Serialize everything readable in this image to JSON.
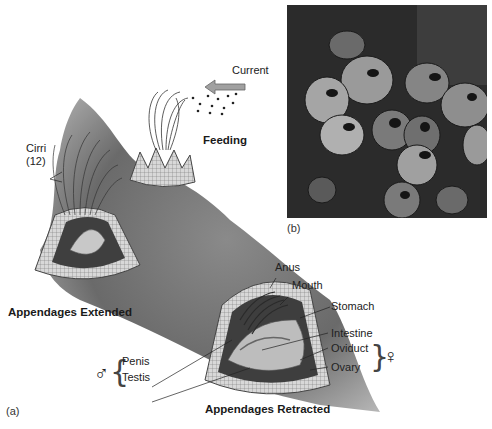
{
  "figure": {
    "panel_a": {
      "label": "(a)",
      "titles": {
        "feeding": "Feeding",
        "extended": "Appendages Extended",
        "retracted": "Appendages Retracted"
      },
      "current_label": "Current",
      "cirri_label_line1": "Cirri",
      "cirri_label_line2": "(12)",
      "anatomy_labels": {
        "anus": "Anus",
        "mouth": "Mouth",
        "stomach": "Stomach",
        "intestine": "Intestine",
        "oviduct": "Oviduct",
        "ovary": "Ovary",
        "penis": "Penis",
        "testis": "Testis"
      },
      "male_symbol": "♂",
      "female_symbol": "♀"
    },
    "panel_b": {
      "label": "(b)",
      "content": "Photograph of barnacles on rock"
    }
  },
  "colors": {
    "rock": "#6e6e6e",
    "rock_dark": "#4a4a4a",
    "shell": "#cfcfcf",
    "photo_bg": "#2a2a2a",
    "arrow": "#9a9a9a"
  }
}
